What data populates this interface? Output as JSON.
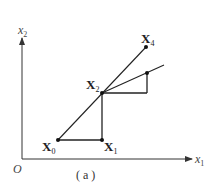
{
  "diagram": {
    "caption": "( a )",
    "origin_label": "O",
    "axes": {
      "x": {
        "label": "x",
        "sub": "1"
      },
      "y": {
        "label": "x",
        "sub": "2"
      }
    },
    "points": {
      "X0": {
        "label": "X",
        "sub": "0"
      },
      "X1": {
        "label": "X",
        "sub": "1"
      },
      "X2": {
        "label": "X",
        "sub": "2"
      },
      "X4": {
        "label": "X",
        "sub": "4"
      }
    },
    "colors": {
      "stroke": "#222222",
      "axis": "#333333",
      "background": "#ffffff"
    }
  }
}
